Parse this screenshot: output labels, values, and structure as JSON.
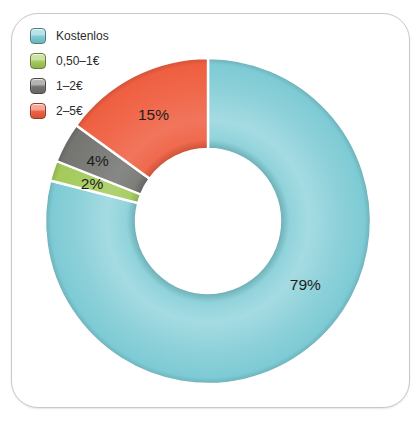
{
  "chart_data": {
    "type": "pie",
    "donut": true,
    "start_angle_deg": 0,
    "direction": "clockwise",
    "categories": [
      "Kostenlos",
      "0,50–1€",
      "1–2€",
      "2–5€"
    ],
    "values": [
      79,
      2,
      4,
      15
    ],
    "labels": [
      "79%",
      "2%",
      "4%",
      "15%"
    ],
    "colors": [
      "#7ecbd5",
      "#a3ca5b",
      "#747471",
      "#ef5f41"
    ],
    "separator_color": "#ffffff",
    "legend_position": "top-left"
  },
  "legend": {
    "items": [
      {
        "label": "Kostenlos",
        "color": "#7ecbd5"
      },
      {
        "label": "0,50–1€",
        "color": "#a3ca5b"
      },
      {
        "label": "1–2€",
        "color": "#747471"
      },
      {
        "label": "2–5€",
        "color": "#ef5f41"
      }
    ]
  }
}
